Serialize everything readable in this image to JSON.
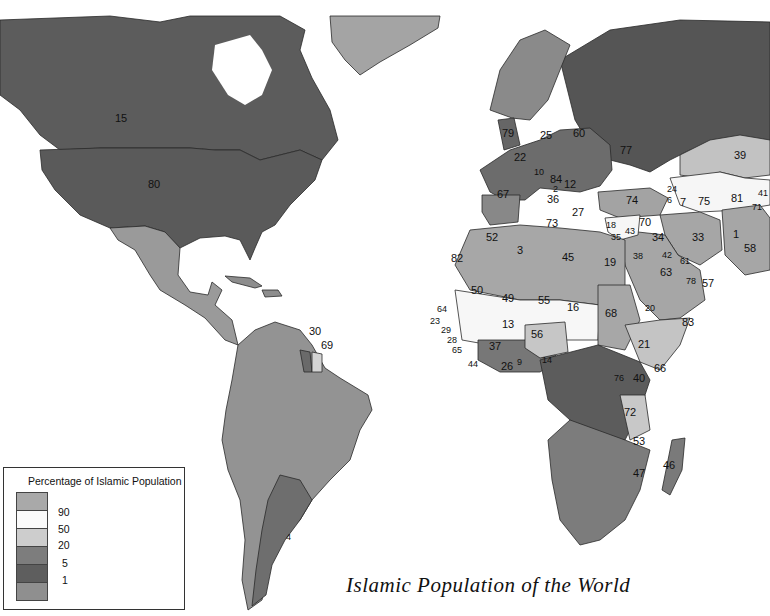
{
  "title": "Islamic Population of the World",
  "legend": {
    "title": "Percentage of Islamic Population",
    "classes": [
      {
        "label": "",
        "range": ">90",
        "color": "#a9a9a9"
      },
      {
        "label": "90",
        "range": "50-90",
        "color": "#fbfbfb"
      },
      {
        "label": "50",
        "range": "20-50",
        "color": "#cdcdcd"
      },
      {
        "label": "20",
        "range": "5-20",
        "color": "#7d7d7d"
      },
      {
        "label": "5",
        "range": "1-5",
        "color": "#5e5e5e"
      },
      {
        "label": "1",
        "range": "<1",
        "color": "#8f8f8f"
      }
    ]
  },
  "labels": [
    {
      "id": "15",
      "region": "Canada"
    },
    {
      "id": "80",
      "region": "United States"
    },
    {
      "id": "30",
      "region": "Trinidad and Tobago"
    },
    {
      "id": "69",
      "region": "Suriname"
    },
    {
      "id": "4",
      "region": "Argentina"
    },
    {
      "id": "79",
      "region": "United Kingdom"
    },
    {
      "id": "25",
      "region": "Germany"
    },
    {
      "id": "60",
      "region": "Poland"
    },
    {
      "id": "77",
      "region": "Ukraine"
    },
    {
      "id": "22",
      "region": "France"
    },
    {
      "id": "10",
      "region": "Slovenia/Croatia"
    },
    {
      "id": "84",
      "region": "Serbia"
    },
    {
      "id": "12",
      "region": "Bulgaria"
    },
    {
      "id": "67",
      "region": "Spain"
    },
    {
      "id": "36",
      "region": "Italy"
    },
    {
      "id": "27",
      "region": "Greece"
    },
    {
      "id": "2",
      "region": "Albania"
    },
    {
      "id": "74",
      "region": "Turkey"
    },
    {
      "id": "24",
      "region": "Georgia"
    },
    {
      "id": "6",
      "region": "Armenia"
    },
    {
      "id": "7",
      "region": "Azerbaijan"
    },
    {
      "id": "75",
      "region": "Turkmenistan/Uzbekistan"
    },
    {
      "id": "81",
      "region": "Tajikistan"
    },
    {
      "id": "41",
      "region": "Kyrgyzstan"
    },
    {
      "id": "71",
      "region": "Tajikistan border"
    },
    {
      "id": "39",
      "region": "Kazakhstan"
    },
    {
      "id": "18",
      "region": "Cyprus"
    },
    {
      "id": "35",
      "region": "Lebanon"
    },
    {
      "id": "43",
      "region": "Israel"
    },
    {
      "id": "70",
      "region": "Syria"
    },
    {
      "id": "34",
      "region": "Iraq"
    },
    {
      "id": "33",
      "region": "Iran"
    },
    {
      "id": "1",
      "region": "Afghanistan"
    },
    {
      "id": "58",
      "region": "Pakistan"
    },
    {
      "id": "38",
      "region": "Jordan"
    },
    {
      "id": "42",
      "region": "Kuwait"
    },
    {
      "id": "61",
      "region": "Bahrain"
    },
    {
      "id": "63",
      "region": "Saudi Arabia"
    },
    {
      "id": "78",
      "region": "UAE"
    },
    {
      "id": "57",
      "region": "Oman"
    },
    {
      "id": "20",
      "region": "Eritrea"
    },
    {
      "id": "83",
      "region": "Yemen"
    },
    {
      "id": "73",
      "region": "Tunisia"
    },
    {
      "id": "52",
      "region": "Morocco"
    },
    {
      "id": "3",
      "region": "Algeria"
    },
    {
      "id": "45",
      "region": "Libya"
    },
    {
      "id": "19",
      "region": "Egypt"
    },
    {
      "id": "82",
      "region": "Western Sahara"
    },
    {
      "id": "50",
      "region": "Mauritania"
    },
    {
      "id": "49",
      "region": "Mali"
    },
    {
      "id": "55",
      "region": "Niger"
    },
    {
      "id": "16",
      "region": "Chad"
    },
    {
      "id": "68",
      "region": "Sudan"
    },
    {
      "id": "64",
      "region": "Senegal"
    },
    {
      "id": "23",
      "region": "Gambia"
    },
    {
      "id": "29",
      "region": "Guinea-Bissau"
    },
    {
      "id": "28",
      "region": "Guinea"
    },
    {
      "id": "65",
      "region": "Sierra Leone"
    },
    {
      "id": "44",
      "region": "Liberia"
    },
    {
      "id": "37",
      "region": "Cote d'Ivoire"
    },
    {
      "id": "13",
      "region": "Burkina Faso"
    },
    {
      "id": "26",
      "region": "Ghana"
    },
    {
      "id": "9",
      "region": "Togo/Benin"
    },
    {
      "id": "56",
      "region": "Nigeria"
    },
    {
      "id": "14",
      "region": "Cameroon"
    },
    {
      "id": "21",
      "region": "Ethiopia"
    },
    {
      "id": "66",
      "region": "Somalia"
    },
    {
      "id": "40",
      "region": "Kenya"
    },
    {
      "id": "76",
      "region": "Uganda"
    },
    {
      "id": "72",
      "region": "Tanzania"
    },
    {
      "id": "53",
      "region": "Mozambique"
    },
    {
      "id": "47",
      "region": "Malawi"
    },
    {
      "id": "46",
      "region": "Madagascar"
    }
  ]
}
